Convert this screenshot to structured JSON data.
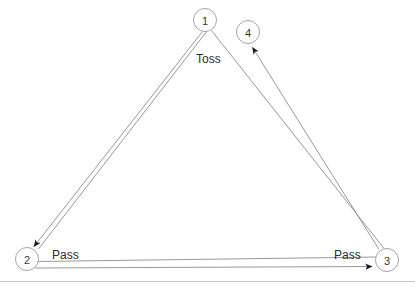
{
  "diagram": {
    "type": "node-link-diagram",
    "background_color": "#ffffff",
    "stroke_color": "#8c8c8c",
    "node_stroke_color": "#9a9a9a",
    "arrow_color": "#1a1a1a",
    "text_color": "#2b2b2b",
    "divider_color": "#c8c8c8",
    "nodes": [
      {
        "id": "1",
        "label": "1",
        "cx": 205,
        "cy": 20,
        "r": 11.5
      },
      {
        "id": "4",
        "label": "4",
        "cx": 248,
        "cy": 32,
        "r": 11.5
      },
      {
        "id": "2",
        "label": "2",
        "cx": 27,
        "cy": 259,
        "r": 11.5
      },
      {
        "id": "3",
        "label": "3",
        "cx": 387,
        "cy": 260,
        "r": 11.5
      }
    ],
    "edges": [
      {
        "id": "edge-1-to-2",
        "from": "1",
        "to": "2",
        "label": "Toss",
        "arrow": true,
        "style": "double-line"
      },
      {
        "id": "edge-3-to-4",
        "from": "3",
        "to": "4",
        "label": "",
        "arrow": true,
        "style": "double-line"
      },
      {
        "id": "edge-2-to-3",
        "from": "2",
        "to": "3",
        "label": "Pass",
        "arrow": true,
        "style": "double-line"
      }
    ],
    "labels": [
      {
        "id": "label-toss",
        "text": "Toss",
        "x": 196,
        "y": 63
      },
      {
        "id": "label-pass-left",
        "text": "Pass",
        "x": 52,
        "y": 259
      },
      {
        "id": "label-pass-right",
        "text": "Pass",
        "x": 334,
        "y": 259
      }
    ],
    "divider": {
      "y": 281,
      "x1": 0,
      "x2": 415
    }
  }
}
